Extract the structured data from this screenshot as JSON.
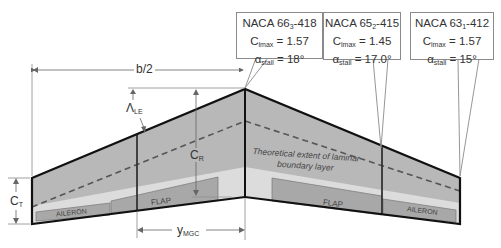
{
  "diagram": {
    "type": "wing-planform",
    "colors": {
      "outline": "#111111",
      "wing_fill_dark": "#b8b8b8",
      "wing_fill_light": "#dcdcdc",
      "control_surface": "#a8a8a8",
      "dimension_line": "#777777"
    },
    "dimensions": {
      "half_span": "b/2",
      "sweep_main": "Λ",
      "sweep_sub": "LE",
      "root_chord_main": "C",
      "root_chord_sub": "R",
      "tip_chord_main": "C",
      "tip_chord_sub": "T",
      "mgc_main": "y",
      "mgc_sub": "MGC"
    },
    "annotations": {
      "laminar_line1": "Theoretical extent of laminar",
      "laminar_line2": "boundary layer"
    },
    "surfaces": {
      "left_aileron": "AILERON",
      "left_flap": "FLAP",
      "right_flap": "FLAP",
      "right_aileron": "AILERON"
    },
    "callouts": [
      {
        "airfoil_pre": "NACA 66",
        "airfoil_sub": "3",
        "airfoil_post": "-418",
        "cl_label": "C",
        "cl_sub": "lmax",
        "cl_value": "= 1.57",
        "alpha_label": "α",
        "alpha_sub": "stall",
        "alpha_value": "= 18°"
      },
      {
        "airfoil_pre": "NACA 65",
        "airfoil_sub": "2",
        "airfoil_post": "-415",
        "cl_label": "C",
        "cl_sub": "lmax",
        "cl_value": "= 1.45",
        "alpha_label": "α",
        "alpha_sub": "stall",
        "alpha_value": "= 17.0°"
      },
      {
        "airfoil_pre": "NACA 63",
        "airfoil_sub": "1",
        "airfoil_post": "-412",
        "cl_label": "C",
        "cl_sub": "lmax",
        "cl_value": "= 1.57",
        "alpha_label": "α",
        "alpha_sub": "stall",
        "alpha_value": "= 15°"
      }
    ]
  }
}
